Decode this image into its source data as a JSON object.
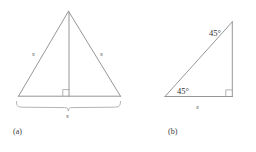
{
  "figure": {
    "background_color": "#ffffff",
    "line_color": "#8a8a8a",
    "text_color": "#3a3a3a",
    "panels": [
      {
        "caption": "(a)",
        "shape": "equilateral-triangle-with-altitude",
        "labels": {
          "left_side": "s",
          "right_side": "s",
          "base_brace": "s"
        },
        "markers": {
          "altitude_foot": "right-angle"
        }
      },
      {
        "caption": "(b)",
        "shape": "right-isosceles-triangle",
        "labels": {
          "bottom_left_angle": "45°",
          "upper_right_angle": "45°",
          "base": "s"
        },
        "markers": {
          "bottom_right_corner": "right-angle"
        }
      }
    ]
  },
  "panel_a": {
    "caption": "(a)",
    "side_left_label": "s",
    "side_right_label": "s",
    "base_label": "s"
  },
  "panel_b": {
    "caption": "(b)",
    "angle_left_label": "45°",
    "angle_top_label": "45°",
    "base_label": "s"
  }
}
